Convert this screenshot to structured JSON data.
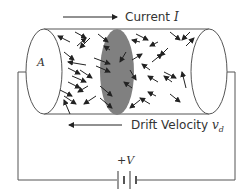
{
  "diagram": {
    "labels": {
      "current": "Current",
      "current_symbol": "I",
      "drift": "Drift Velocity",
      "drift_symbol": "v",
      "drift_subscript": "d",
      "area": "A",
      "voltage": "+V"
    },
    "colors": {
      "line": "#555555",
      "arrow": "#222222",
      "cross_section": "#808080"
    }
  }
}
